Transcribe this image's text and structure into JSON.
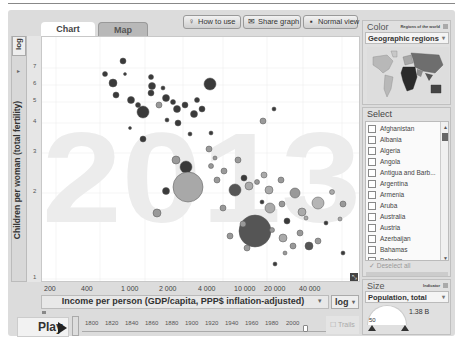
{
  "tabs": [
    {
      "label": "Chart",
      "active": true
    },
    {
      "label": "Map",
      "active": false
    }
  ],
  "toolbar": {
    "how_to_use": "How to use",
    "share_graph": "Share graph",
    "normal_view": "Normal view"
  },
  "y_axis": {
    "scale": "log",
    "label": "Children per woman (total fertility)",
    "ticks": [
      "7",
      "6",
      "5",
      "4",
      "3",
      "2",
      "1"
    ]
  },
  "x_axis": {
    "scale": "log",
    "label": "Income per person (GDP/capita, PPP$ inflation-adjusted)",
    "ticks": [
      "200",
      "400",
      "1 000",
      "2 000",
      "4 000",
      "10 000",
      "20 000",
      "40 000"
    ]
  },
  "chart": {
    "year_watermark": "2013"
  },
  "playback": {
    "play_label": "Play",
    "years": [
      "1800",
      "1820",
      "1840",
      "1860",
      "1880",
      "1900",
      "1920",
      "1940",
      "1960",
      "1980",
      "2000"
    ],
    "trails_label": "Trails"
  },
  "color_panel": {
    "title": "Color",
    "subtitle": "Regions of the world",
    "selected": "Geographic regions"
  },
  "select_panel": {
    "title": "Select",
    "countries": [
      "Afghanistan",
      "Albania",
      "Algeria",
      "Angola",
      "Antigua and Barb...",
      "Argentina",
      "Armenia",
      "Aruba",
      "Australia",
      "Austria",
      "Azerbaijan",
      "Bahamas",
      "Bahrain"
    ],
    "deselect_label": "Deselect all"
  },
  "size_panel": {
    "title": "Size",
    "subtitle": "Indicator",
    "selected": "Population, total",
    "max_value": "1.38 B",
    "min_value": "50"
  },
  "colors": {
    "panel_bg": "#e0e0e0",
    "watermark": "#ececec",
    "bubble_dark": "#3a3a3a",
    "bubble_mid": "#8a8a8a",
    "bubble_light": "#b5b5b5"
  }
}
